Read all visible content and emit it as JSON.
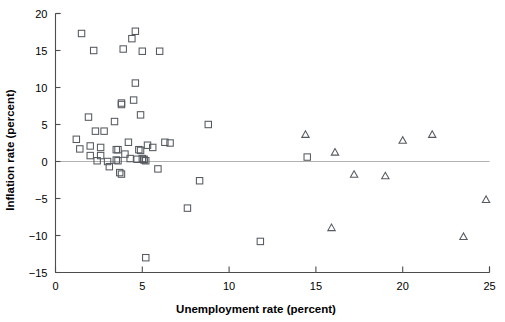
{
  "chart_data": {
    "type": "scatter",
    "title": "",
    "xlabel": "Unemployment rate (percent)",
    "ylabel": "Inflation rate (percent)",
    "xlim": [
      0,
      25
    ],
    "ylim": [
      -15,
      20
    ],
    "xticks": [
      0,
      5,
      10,
      15,
      20,
      25
    ],
    "yticks": [
      20,
      15,
      10,
      5,
      0,
      -5,
      -10,
      -15
    ],
    "xtick_labels": [
      "0",
      "5",
      "10",
      "15",
      "20",
      "25"
    ],
    "ytick_labels": [
      "20",
      "15",
      "10",
      "5",
      "0",
      "−5",
      "−10",
      "−15"
    ],
    "grid": false,
    "legend": "none",
    "zero_line": 0,
    "marker_color": "#555a60",
    "axis_color": "#4d4d4d",
    "zero_line_color": "#b0b0b0",
    "series": [
      {
        "name": "square-series",
        "marker": "square",
        "points": [
          [
            1.5,
            17.3
          ],
          [
            2.2,
            15.0
          ],
          [
            3.9,
            15.2
          ],
          [
            4.4,
            16.6
          ],
          [
            4.6,
            17.6
          ],
          [
            5.0,
            14.9
          ],
          [
            6.0,
            14.9
          ],
          [
            4.6,
            10.6
          ],
          [
            3.8,
            7.9
          ],
          [
            3.8,
            7.7
          ],
          [
            4.5,
            8.3
          ],
          [
            4.9,
            6.3
          ],
          [
            1.9,
            6.0
          ],
          [
            2.8,
            4.1
          ],
          [
            2.3,
            4.1
          ],
          [
            3.4,
            5.4
          ],
          [
            1.2,
            3.0
          ],
          [
            1.4,
            1.7
          ],
          [
            2.0,
            2.1
          ],
          [
            2.0,
            0.8
          ],
          [
            2.6,
            1.9
          ],
          [
            2.6,
            0.8
          ],
          [
            3.1,
            -0.7
          ],
          [
            3.5,
            1.6
          ],
          [
            3.6,
            1.6
          ],
          [
            3.5,
            0.2
          ],
          [
            3.6,
            0.1
          ],
          [
            3.7,
            -1.5
          ],
          [
            3.8,
            -1.7
          ],
          [
            4.2,
            2.6
          ],
          [
            4.3,
            0.4
          ],
          [
            4.7,
            0.3
          ],
          [
            4.8,
            1.6
          ],
          [
            4.9,
            1.5
          ],
          [
            5.0,
            0.4
          ],
          [
            5.1,
            0.3
          ],
          [
            5.1,
            0.2
          ],
          [
            5.2,
            0.1
          ],
          [
            5.3,
            2.2
          ],
          [
            5.6,
            1.9
          ],
          [
            5.9,
            -1.0
          ],
          [
            6.3,
            2.6
          ],
          [
            6.6,
            2.5
          ],
          [
            7.6,
            -6.3
          ],
          [
            8.8,
            5.0
          ],
          [
            8.3,
            -2.6
          ],
          [
            5.2,
            -13.0
          ],
          [
            11.8,
            -10.8
          ],
          [
            14.5,
            0.6
          ],
          [
            4.0,
            1.0
          ],
          [
            2.4,
            0.1
          ],
          [
            3.0,
            0.0
          ]
        ]
      },
      {
        "name": "triangle-series",
        "marker": "triangle",
        "points": [
          [
            14.4,
            3.6
          ],
          [
            16.1,
            1.2
          ],
          [
            17.2,
            -1.8
          ],
          [
            19.0,
            -2.0
          ],
          [
            20.0,
            2.8
          ],
          [
            21.7,
            3.6
          ],
          [
            15.9,
            -9.0
          ],
          [
            23.5,
            -10.2
          ],
          [
            24.8,
            -5.2
          ]
        ]
      }
    ]
  }
}
